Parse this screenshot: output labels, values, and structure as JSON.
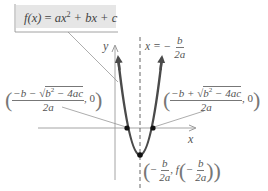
{
  "diagram": {
    "function_label": {
      "lhs": "f(x)",
      "equals": " = ",
      "rhs_a": "ax",
      "exp": "2",
      "rhs_rest": " + bx + c"
    },
    "axis_labels": {
      "x": "x",
      "y": "y"
    },
    "axis_of_symmetry": {
      "lhs": "x = −",
      "num": "b",
      "den": "2a"
    },
    "left_root": {
      "num": "−b −√b² − 4ac",
      "num_prefix": "−b − ",
      "radicand": "b",
      "radicand_exp": "2",
      "radicand_rest": " − 4ac",
      "den": "2a",
      "y": ", 0"
    },
    "right_root": {
      "num_prefix": "−b + ",
      "radicand": "b",
      "radicand_exp": "2",
      "radicand_rest": " − 4ac",
      "den": "2a",
      "y": ", 0"
    },
    "vertex": {
      "x_neg": "−",
      "x_num": "b",
      "x_den": "2a",
      "sep": ", ",
      "f": "f",
      "inner_neg": "−",
      "inner_num": "b",
      "inner_den": "2a"
    },
    "colors": {
      "curve": "#4a4a4a",
      "axes": "#9a9a9a",
      "leader_lines": "#8a8a8a",
      "formula_box_bg": "#e6e6e6",
      "points": "#111111",
      "text": "#555555"
    }
  }
}
